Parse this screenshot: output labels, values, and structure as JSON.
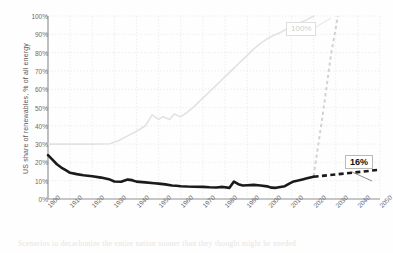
{
  "chart_data": {
    "type": "line",
    "title": "",
    "xlabel": "",
    "ylabel": "US  share of renewables, % of all energy",
    "xlim": [
      1900,
      2050
    ],
    "ylim": [
      0,
      100
    ],
    "grid": true,
    "legend": "none",
    "ytick_labels": [
      "100%",
      "90%",
      "80%",
      "70%",
      "60%",
      "50%",
      "40%",
      "30%",
      "20%",
      "10%",
      "0%"
    ],
    "ytick_values": [
      100,
      90,
      80,
      70,
      60,
      50,
      40,
      30,
      20,
      10,
      0
    ],
    "xtick_labels": [
      "1900",
      "1910",
      "1920",
      "1930",
      "1940",
      "1950",
      "1960",
      "1970",
      "1980",
      "1990",
      "2000",
      "2010",
      "2020",
      "2030",
      "2040",
      "2050"
    ],
    "xtick_values": [
      1900,
      1910,
      1920,
      1930,
      1940,
      1950,
      1960,
      1970,
      1980,
      1990,
      2000,
      2010,
      2020,
      2030,
      2040,
      2050
    ],
    "series": [
      {
        "name": "US renewables share - historical",
        "style": "solid",
        "color": "#1a1a1a",
        "width": 2.6,
        "x": [
          1900,
          1902,
          1904,
          1906,
          1908,
          1910,
          1913,
          1916,
          1920,
          1924,
          1928,
          1930,
          1933,
          1936,
          1938,
          1940,
          1944,
          1948,
          1950,
          1953,
          1956,
          1958,
          1960,
          1963,
          1966,
          1970,
          1973,
          1976,
          1979,
          1982,
          1984,
          1986,
          1988,
          1990,
          1993,
          1996,
          1999,
          2001,
          2003,
          2005,
          2007,
          2009,
          2011,
          2013,
          2015,
          2017,
          2019,
          2020
        ],
        "y": [
          24.0,
          21.5,
          19.0,
          17.2,
          15.8,
          14.3,
          13.6,
          13.0,
          12.4,
          11.7,
          10.6,
          9.6,
          9.4,
          10.6,
          10.3,
          9.5,
          9.1,
          8.6,
          8.4,
          8.0,
          7.4,
          7.2,
          7.0,
          6.8,
          6.7,
          6.6,
          6.4,
          6.3,
          6.6,
          6.1,
          9.5,
          8.1,
          7.4,
          7.5,
          7.7,
          7.4,
          6.9,
          6.2,
          6.1,
          6.6,
          7.0,
          8.4,
          9.6,
          10.1,
          10.7,
          11.3,
          11.9,
          12.2
        ]
      },
      {
        "name": "US renewables share - projection to 16%",
        "style": "dashed",
        "color": "#1a1a1a",
        "width": 2.6,
        "x": [
          2020,
          2030,
          2040,
          2050
        ],
        "y": [
          12.2,
          13.4,
          14.7,
          16.0
        ]
      },
      {
        "name": "100% scenario - background trend",
        "style": "solid",
        "color": "#e2e2e2",
        "width": 1.6,
        "x": [
          1900,
          1910,
          1920,
          1928,
          1932,
          1936,
          1940,
          1944,
          1947,
          1950,
          1952,
          1955,
          1957,
          1960,
          1963,
          1966,
          1969,
          1972,
          1975,
          1978,
          1981,
          1984,
          1987,
          1990,
          1993,
          1996,
          1999,
          2002,
          2005,
          2008,
          2011,
          2014,
          2017,
          2020
        ],
        "y": [
          30.0,
          30.0,
          30.0,
          30.2,
          32.0,
          34.5,
          37.0,
          40.0,
          46.0,
          43.5,
          45.0,
          43.5,
          46.5,
          45.0,
          47.5,
          50.5,
          54.0,
          57.5,
          61.0,
          64.5,
          68.0,
          71.5,
          75.0,
          78.5,
          82.0,
          85.0,
          87.5,
          89.5,
          91.0,
          93.0,
          95.0,
          96.5,
          98.0,
          100.0
        ]
      },
      {
        "name": "100% scenario - steep projection",
        "style": "dashed",
        "color": "#d2d2d2",
        "width": 2.0,
        "x": [
          2020,
          2024,
          2028,
          2031
        ],
        "y": [
          12.5,
          45.0,
          80.0,
          100.0
        ]
      }
    ],
    "annotations": [
      {
        "label": "100%",
        "tone": "light",
        "value": 100,
        "year": 2031
      },
      {
        "label": "16%",
        "tone": "dark",
        "value": 16,
        "year": 2050
      }
    ],
    "ghost_text": "Scenarios to decarbonize the entire nation sooner than they thought might be needed"
  }
}
